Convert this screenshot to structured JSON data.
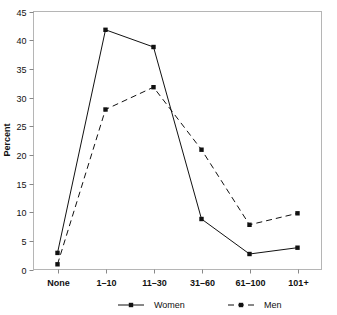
{
  "chart_data": {
    "type": "line",
    "title": "",
    "xlabel": "",
    "ylabel": "Percent",
    "categories": [
      "None",
      "1–10",
      "11–30",
      "31–60",
      "61–100",
      "101+"
    ],
    "series": [
      {
        "name": "Women",
        "style": "solid",
        "marker": "filled-square",
        "color": "#111111",
        "values": [
          2.9,
          41.8,
          38.8,
          8.8,
          2.7,
          3.8
        ]
      },
      {
        "name": "Men",
        "style": "dashed",
        "marker": "filled-square",
        "color": "#111111",
        "values": [
          0.9,
          27.9,
          31.8,
          20.9,
          7.8,
          9.8
        ]
      }
    ],
    "ylim": [
      0,
      45
    ],
    "yticks": [
      0,
      5,
      10,
      15,
      20,
      25,
      30,
      35,
      40,
      45
    ],
    "ytick_labels": [
      "0",
      "5",
      "10",
      "15",
      "20",
      "25",
      "30",
      "35",
      "40",
      "45"
    ],
    "grid": false,
    "legend_position": "bottom",
    "frame": true
  },
  "legend": {
    "entries": [
      {
        "label": "Women",
        "style": "solid"
      },
      {
        "label": "Men",
        "style": "dashed"
      }
    ]
  },
  "colors": {
    "line": "#111111",
    "frame": "#aaaaaa",
    "tick": "#888888",
    "text": "#111111",
    "background": "#ffffff"
  }
}
